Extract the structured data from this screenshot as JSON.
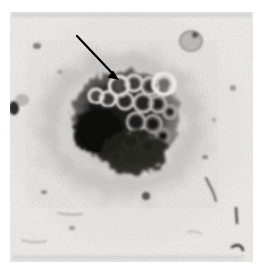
{
  "figure": {
    "kind": "light-micrograph",
    "caption_text": "",
    "page_background": "#ffffff"
  },
  "image": {
    "name": "cell-colony-micrograph",
    "frame": {
      "x": 10,
      "y": 12,
      "width": 243,
      "height": 250
    },
    "background_tone": "#f0efee",
    "grain_tone": "#d6d4d1",
    "specimen_center": {
      "x": 122,
      "y": 122
    }
  },
  "annotations": {
    "arrow": {
      "name": "pointer-arrow",
      "color": "#000000",
      "tail": {
        "x": 77,
        "y": 36
      },
      "tip": {
        "x": 119,
        "y": 80
      },
      "width": 2.2,
      "head_length": 11,
      "head_width": 9,
      "points_at": "ring-shaped vesicular structures at colony margin"
    }
  },
  "specimen": {
    "halo": {
      "name": "diffuse-granular-halo",
      "cx": 122,
      "cy": 124,
      "rx": 78,
      "ry": 68,
      "tone": "#9d9a97"
    },
    "dark_mass": {
      "name": "dense-dark-mass",
      "cx": 100,
      "cy": 131,
      "rx": 25,
      "ry": 24,
      "tone": "#090909"
    },
    "cluster": {
      "name": "cell-cluster-core",
      "cx": 126,
      "cy": 118,
      "rx": 52,
      "ry": 46,
      "tone": "#2b2927"
    },
    "vesicles": [
      {
        "name": "ring-vesicle",
        "cx": 119,
        "cy": 86,
        "r": 9.5,
        "ring": "#e9e6e2",
        "core": "#4a4744"
      },
      {
        "name": "ring-vesicle",
        "cx": 134,
        "cy": 83,
        "r": 8.0,
        "ring": "#ddd9d5",
        "core": "#3c3936"
      },
      {
        "name": "ring-vesicle",
        "cx": 150,
        "cy": 86,
        "r": 8.5,
        "ring": "#cfcbc7",
        "core": "#2e2b29"
      },
      {
        "name": "ring-vesicle",
        "cx": 164,
        "cy": 84,
        "r": 10.5,
        "ring": "#f2efeb",
        "core": "#6d6a66"
      },
      {
        "name": "ring-vesicle",
        "cx": 108,
        "cy": 99,
        "r": 7.5,
        "ring": "#e4e1dd",
        "core": "#393633"
      },
      {
        "name": "ring-vesicle",
        "cx": 125,
        "cy": 101,
        "r": 8.0,
        "ring": "#d2cecа",
        "core": "#26241f"
      },
      {
        "name": "ring-vesicle",
        "cx": 143,
        "cy": 103,
        "r": 9.0,
        "ring": "#c6c2be",
        "core": "#201e1c"
      },
      {
        "name": "ring-vesicle",
        "cx": 158,
        "cy": 104,
        "r": 8.0,
        "ring": "#bdb9b5",
        "core": "#1b1917"
      },
      {
        "name": "ring-vesicle",
        "cx": 136,
        "cy": 122,
        "r": 9.0,
        "ring": "#b3afab",
        "core": "#141312"
      },
      {
        "name": "ring-vesicle",
        "cx": 153,
        "cy": 124,
        "r": 8.5,
        "ring": "#a9a5a1",
        "core": "#121110"
      },
      {
        "name": "ring-vesicle",
        "cx": 131,
        "cy": 142,
        "r": 8.0,
        "ring": "#a29e9a",
        "core": "#121110"
      },
      {
        "name": "ring-vesicle",
        "cx": 148,
        "cy": 146,
        "r": 7.5,
        "ring": "#9a9692",
        "core": "#101010"
      },
      {
        "name": "ring-vesicle",
        "cx": 163,
        "cy": 136,
        "r": 7.0,
        "ring": "#959190",
        "core": "#101010"
      },
      {
        "name": "ring-vesicle",
        "cx": 116,
        "cy": 156,
        "r": 6.5,
        "ring": "#8e8a87",
        "core": "#121110"
      },
      {
        "name": "ring-vesicle",
        "cx": 96,
        "cy": 96,
        "r": 7.0,
        "ring": "#e7e4e0",
        "core": "#45423f"
      },
      {
        "name": "ring-vesicle",
        "cx": 170,
        "cy": 112,
        "r": 6.5,
        "ring": "#b0acа8",
        "core": "#1e1c1a"
      }
    ]
  },
  "debris": [
    {
      "name": "debris-cell",
      "cx": 191,
      "cy": 41,
      "rx": 11,
      "ry": 10,
      "tone": "#b8b5b1"
    },
    {
      "name": "debris-spot",
      "cx": 14,
      "cy": 108,
      "rx": 5,
      "ry": 7,
      "tone": "#2a2825"
    },
    {
      "name": "debris-spot",
      "cx": 37,
      "cy": 46,
      "rx": 4,
      "ry": 3,
      "tone": "#7e7b78"
    },
    {
      "name": "debris-spot",
      "cx": 44,
      "cy": 192,
      "rx": 3,
      "ry": 2,
      "tone": "#8b8885"
    },
    {
      "name": "debris-spot",
      "cx": 146,
      "cy": 196,
      "rx": 4,
      "ry": 4,
      "tone": "#55524f"
    },
    {
      "name": "debris-spot",
      "cx": 205,
      "cy": 157,
      "rx": 3,
      "ry": 2,
      "tone": "#8a8784"
    },
    {
      "name": "debris-spot",
      "cx": 72,
      "cy": 228,
      "rx": 3,
      "ry": 2,
      "tone": "#9a9794"
    },
    {
      "name": "debris-spot",
      "cx": 233,
      "cy": 88,
      "rx": 3,
      "ry": 3,
      "tone": "#9e9b98"
    }
  ],
  "fibers": [
    {
      "name": "debris-fiber",
      "path": "M 206 178 L 213 192 L 216 201",
      "tone": "#5e5b58",
      "width": 2.0
    },
    {
      "name": "debris-fiber",
      "path": "M 236 208 L 237 223",
      "tone": "#4a4744",
      "width": 2.4
    },
    {
      "name": "debris-fiber",
      "path": "M 232 247 Q 240 242 243 250",
      "tone": "#3a3835",
      "width": 2.6
    },
    {
      "name": "debris-fiber",
      "path": "M 58 213 Q 70 216 82 214",
      "tone": "#a5a29f",
      "width": 1.6
    },
    {
      "name": "debris-fiber",
      "path": "M 22 240 Q 34 244 46 241",
      "tone": "#adaaa7",
      "width": 1.5
    }
  ],
  "scan_noise": [
    {
      "name": "scan-streak-top",
      "x": 12,
      "y": 13,
      "width": 239,
      "height": 4,
      "tone": "#c9c6c3"
    },
    {
      "name": "scan-streak-bottom",
      "x": 12,
      "y": 255,
      "width": 232,
      "height": 5,
      "tone": "#d2cfcc"
    },
    {
      "name": "scan-streak-edge",
      "x": 14,
      "y": 262,
      "width": 70,
      "height": 3,
      "tone": "#e6e4e2"
    }
  ]
}
